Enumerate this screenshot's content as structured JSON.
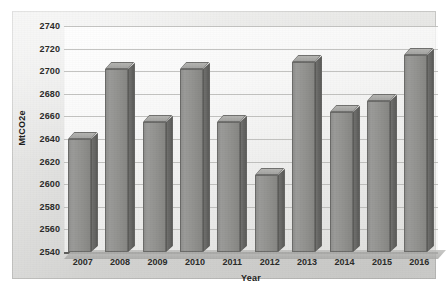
{
  "chart_data": {
    "type": "bar",
    "title": "",
    "xlabel": "Year",
    "ylabel": "MtCO2e",
    "categories": [
      "2007",
      "2008",
      "2009",
      "2010",
      "2011",
      "2012",
      "2013",
      "2014",
      "2015",
      "2016"
    ],
    "values": [
      2640,
      2702,
      2655,
      2702,
      2655,
      2608,
      2708,
      2664,
      2674,
      2714
    ],
    "ylim": [
      2540,
      2740
    ],
    "ytick_step": 20,
    "ytick_labels": [
      "2740",
      "2720",
      "2700",
      "2680",
      "2660",
      "2640",
      "2620",
      "2600",
      "2580",
      "2560",
      "2540"
    ],
    "grid": true,
    "legend": false,
    "series": [
      {
        "name": "Emissions",
        "values": [
          2640,
          2702,
          2655,
          2702,
          2655,
          2608,
          2708,
          2664,
          2674,
          2714
        ]
      }
    ],
    "colors": {
      "bar_face": "#92928f",
      "bar_side": "#63635f",
      "bar_top": "#a9a9a6",
      "plot_background": "#f6f6f5",
      "panel_background": "#dededc",
      "axis_line": "#5d5d5b",
      "gridline": "#b0b0ae",
      "text": "#2a2a28"
    }
  }
}
